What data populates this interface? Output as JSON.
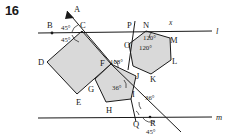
{
  "problem": {
    "number": "16"
  },
  "lines": {
    "top": {
      "label": "l"
    },
    "bottom": {
      "label": "m"
    }
  },
  "unknown": {
    "label": "x"
  },
  "points": {
    "A": "A",
    "B": "B",
    "C": "C",
    "D": "D",
    "E": "E",
    "F": "F",
    "G": "G",
    "H": "H",
    "I": "I",
    "J": "J",
    "K": "K",
    "L": "L",
    "M": "M",
    "N": "N",
    "O": "O",
    "P": "P",
    "Q": "Q",
    "R": "R"
  },
  "angles": {
    "at_C_upper": "45°",
    "at_C_lower": "45°",
    "at_F": "108°",
    "pentagon_interior": "36°",
    "hexagon_upper": "120°",
    "hexagon_lower": "120°",
    "at_I_right": "36°",
    "at_R": "45°"
  },
  "shapes": {
    "square": {
      "name": "square-CDEF",
      "vertices": [
        "C",
        "D",
        "E",
        "F"
      ],
      "fill": "#d9d9d9"
    },
    "pentagon": {
      "name": "pentagon-FGHIJ",
      "vertices": [
        "F",
        "G",
        "H",
        "I",
        "J"
      ],
      "fill": "#d9d9d9"
    },
    "hexagon": {
      "name": "hexagon-NMLKJO",
      "vertices": [
        "N",
        "M",
        "L",
        "K",
        "J",
        "O"
      ],
      "fill": "#d9d9d9"
    }
  },
  "colors": {
    "stroke": "#1a1a1a",
    "fill": "#d9d9d9",
    "background": "#ffffff"
  }
}
